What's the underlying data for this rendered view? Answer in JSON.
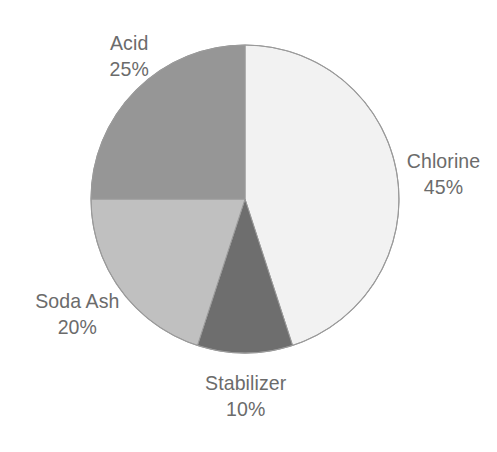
{
  "background_color": "#ffffff",
  "text_color": "#6b6b6b",
  "chart_data": {
    "type": "pie",
    "title": "",
    "subtitle": "",
    "xlabel": "",
    "ylabel": "",
    "legend_position": "none",
    "grid": false,
    "labels_outside": true,
    "start_angle_deg": 0,
    "direction": "clockwise",
    "categories": [
      "Chlorine",
      "Stabilizer",
      "Soda Ash",
      "Acid"
    ],
    "values": [
      45,
      10,
      20,
      25
    ],
    "value_suffix": "%",
    "total": 100,
    "colors": [
      "#f2f2f2",
      "#6e6e6e",
      "#c0c0c0",
      "#969696"
    ],
    "outline_color": "#9a9a9a",
    "slices": [
      {
        "name": "Chlorine",
        "value": 45,
        "label": "Chlorine",
        "value_label": "45%",
        "color": "#f2f2f2",
        "start_deg": 0,
        "end_deg": 162
      },
      {
        "name": "Stabilizer",
        "value": 10,
        "label": "Stabilizer",
        "value_label": "10%",
        "color": "#6e6e6e",
        "start_deg": 162,
        "end_deg": 198
      },
      {
        "name": "Soda Ash",
        "value": 20,
        "label": "Soda Ash",
        "value_label": "20%",
        "color": "#c0c0c0",
        "start_deg": 198,
        "end_deg": 270
      },
      {
        "name": "Acid",
        "value": 25,
        "label": "Acid",
        "value_label": "25%",
        "color": "#969696",
        "start_deg": 270,
        "end_deg": 360
      }
    ]
  },
  "geometry": {
    "center_x": 245,
    "center_y": 199,
    "radius": 154
  }
}
